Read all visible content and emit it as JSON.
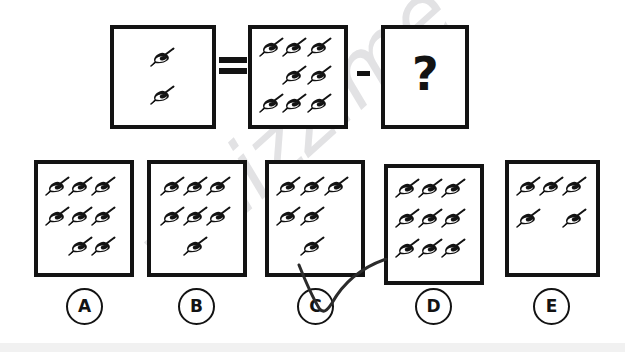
{
  "puzzle": {
    "title": "Visual subtraction reasoning puzzle",
    "icon_name": "spinning-top-icon",
    "equation": {
      "left_box": {
        "name": "result-box",
        "count": 2,
        "rows": [
          {
            "positions": [
              1
            ]
          },
          {
            "positions": [
              1
            ]
          }
        ]
      },
      "equals_symbol": "=",
      "middle_box": {
        "name": "minuend-box",
        "count": 8,
        "rows": [
          {
            "positions": [
              0,
              1,
              2
            ]
          },
          {
            "positions": [
              1,
              2
            ]
          },
          {
            "positions": [
              0,
              1,
              2
            ]
          }
        ]
      },
      "minus_symbol": "-",
      "right_box": {
        "name": "unknown-box",
        "question_mark": "?"
      }
    },
    "options": [
      {
        "id": "A",
        "label": "A",
        "count": 8,
        "rows": [
          {
            "positions": [
              0,
              1,
              2
            ]
          },
          {
            "positions": [
              0,
              1,
              2
            ]
          },
          {
            "positions": [
              1,
              2
            ]
          }
        ],
        "selected": false
      },
      {
        "id": "B",
        "label": "B",
        "count": 7,
        "rows": [
          {
            "positions": [
              0,
              1,
              2
            ]
          },
          {
            "positions": [
              0,
              1,
              2
            ]
          },
          {
            "positions": [
              1
            ]
          }
        ],
        "selected": false
      },
      {
        "id": "C",
        "label": "C",
        "count": 6,
        "rows": [
          {
            "positions": [
              0,
              1,
              2
            ]
          },
          {
            "positions": [
              0,
              1
            ]
          },
          {
            "positions": [
              1
            ]
          }
        ],
        "selected": true
      },
      {
        "id": "D",
        "label": "D",
        "count": 9,
        "rows": [
          {
            "positions": [
              0,
              1,
              2
            ]
          },
          {
            "positions": [
              0,
              1,
              2
            ]
          },
          {
            "positions": [
              0,
              1,
              2
            ]
          }
        ],
        "selected": false
      },
      {
        "id": "E",
        "label": "E",
        "count": 5,
        "rows": [
          {
            "positions": [
              0,
              1,
              2
            ]
          },
          {
            "positions": [
              0,
              2
            ]
          }
        ],
        "selected": false
      }
    ],
    "annotation": {
      "name": "hand-drawn-check-mark",
      "over_option": "C"
    },
    "watermark": {
      "text": "whizz.me",
      "color": "#e2e2e4"
    },
    "colors": {
      "ink": "#131313",
      "paper": "#ffffff",
      "watermark": "#e2e2e4",
      "bottom_bar": "#f1f1f1"
    }
  }
}
